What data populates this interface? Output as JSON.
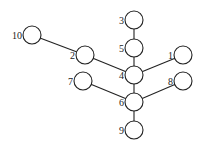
{
  "diagram": {
    "type": "tree",
    "nodes": [
      {
        "id": "1",
        "label": "1",
        "x": 183,
        "y": 55
      },
      {
        "id": "2",
        "label": "2",
        "x": 85,
        "y": 55
      },
      {
        "id": "3",
        "label": "3",
        "x": 134,
        "y": 20
      },
      {
        "id": "4",
        "label": "4",
        "x": 134,
        "y": 75
      },
      {
        "id": "5",
        "label": "5",
        "x": 134,
        "y": 48
      },
      {
        "id": "6",
        "label": "6",
        "x": 134,
        "y": 102
      },
      {
        "id": "7",
        "label": "7",
        "x": 83,
        "y": 81
      },
      {
        "id": "8",
        "label": "8",
        "x": 183,
        "y": 81
      },
      {
        "id": "9",
        "label": "9",
        "x": 134,
        "y": 130
      },
      {
        "id": "10",
        "label": "10",
        "x": 32,
        "y": 35
      }
    ],
    "edges": [
      [
        "10",
        "2"
      ],
      [
        "2",
        "4"
      ],
      [
        "3",
        "5"
      ],
      [
        "5",
        "4"
      ],
      [
        "4",
        "1"
      ],
      [
        "4",
        "6"
      ],
      [
        "7",
        "6"
      ],
      [
        "6",
        "8"
      ],
      [
        "6",
        "9"
      ]
    ]
  }
}
